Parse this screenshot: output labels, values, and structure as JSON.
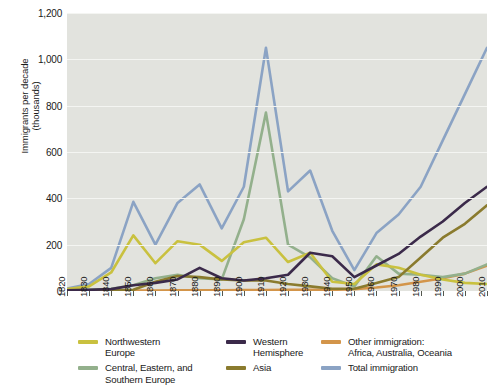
{
  "chart_data": {
    "type": "line",
    "title": "",
    "xlabel": "",
    "ylabel": "Immigrants per decade\n(thousands)",
    "xlim": [
      1820,
      2010
    ],
    "ylim": [
      0,
      1200
    ],
    "ytick_values": [
      0,
      200,
      400,
      600,
      800,
      1000,
      1200
    ],
    "ytick_labels": [
      "0",
      "200",
      "400",
      "600",
      "800",
      "1,000",
      "1,200"
    ],
    "grid": true,
    "grid_axis": "y",
    "legend_position": "below",
    "x": [
      1820,
      1830,
      1840,
      1850,
      1860,
      1870,
      1880,
      1890,
      1900,
      1910,
      1920,
      1930,
      1940,
      1950,
      1960,
      1970,
      1980,
      1990,
      2000,
      2010
    ],
    "categories": [
      "1820",
      "1830",
      "1840",
      "1850",
      "1860",
      "1870",
      "1880",
      "1890",
      "1900",
      "1910",
      "1920",
      "1930",
      "1940",
      "1950",
      "1960",
      "1970",
      "1980",
      "1990",
      "2000",
      "2010"
    ],
    "series": [
      {
        "name": "Northwestern Europe",
        "color": "#c9c13f",
        "values": [
          8,
          20,
          80,
          240,
          120,
          215,
          200,
          130,
          210,
          230,
          125,
          165,
          40,
          30,
          115,
          100,
          70,
          50,
          35,
          30
        ]
      },
      {
        "name": "Central, Eastern, and Southern Europe",
        "color": "#93b08c",
        "values": [
          2,
          5,
          10,
          25,
          55,
          70,
          55,
          50,
          310,
          770,
          200,
          145,
          55,
          20,
          150,
          75,
          70,
          60,
          75,
          115
        ]
      },
      {
        "name": "Western Hemisphere",
        "color": "#3b2a4a",
        "values": [
          3,
          5,
          8,
          25,
          35,
          50,
          100,
          55,
          45,
          55,
          70,
          165,
          150,
          60,
          110,
          160,
          235,
          300,
          380,
          450
        ]
      },
      {
        "name": "Asia",
        "color": "#8a7b2e",
        "values": [
          1,
          1,
          2,
          5,
          40,
          65,
          60,
          50,
          45,
          45,
          30,
          20,
          10,
          10,
          35,
          60,
          145,
          230,
          290,
          370
        ]
      },
      {
        "name": "Other immigration: Africa, Australia, Oceania",
        "color": "#d3954a",
        "values": [
          1,
          1,
          1,
          2,
          2,
          3,
          3,
          3,
          4,
          4,
          5,
          5,
          5,
          8,
          15,
          25,
          40,
          55,
          75,
          110
        ]
      },
      {
        "name": "Total immigration",
        "color": "#8ba3c4",
        "values": [
          10,
          30,
          100,
          385,
          200,
          380,
          460,
          270,
          450,
          1050,
          430,
          520,
          260,
          90,
          250,
          330,
          450,
          650,
          850,
          1050
        ]
      }
    ]
  },
  "axis": {
    "y_label_line1": "Immigrants per decade",
    "y_label_line2": "(thousands)"
  },
  "legend": {
    "columns": [
      {
        "items": [
          {
            "label": "Northwestern\nEurope",
            "color": "#c9c13f",
            "name": "northwestern-europe"
          },
          {
            "label": "Central, Eastern, and\nSouthern Europe",
            "color": "#93b08c",
            "name": "central-eastern-southern-europe"
          }
        ]
      },
      {
        "items": [
          {
            "label": "Western\nHemisphere",
            "color": "#3b2a4a",
            "name": "western-hemisphere"
          },
          {
            "label": "Asia",
            "color": "#8a7b2e",
            "name": "asia"
          }
        ]
      },
      {
        "items": [
          {
            "label": "Other immigration:\nAfrica, Australia, Oceania",
            "color": "#d3954a",
            "name": "other-immigration"
          },
          {
            "label": "Total immigration",
            "color": "#8ba3c4",
            "name": "total-immigration"
          }
        ]
      }
    ]
  }
}
